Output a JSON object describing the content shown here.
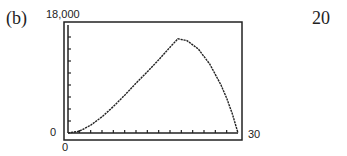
{
  "problem_label": "(b)",
  "next_problem_label": "20",
  "window": {
    "ymax_label": "18,000",
    "ymin_label": "0",
    "xmin_label": "0",
    "xmax_label": "30"
  },
  "chart_data": {
    "type": "line",
    "title": "",
    "xlabel": "",
    "ylabel": "",
    "xlim": [
      0,
      30
    ],
    "ylim": [
      0,
      18000
    ],
    "grid": false,
    "x_tick_step": 2,
    "y_tick_step": 2000,
    "x": [
      0,
      2,
      4,
      6,
      8,
      10,
      12,
      14,
      16,
      18,
      19.4,
      21,
      23,
      25,
      27,
      28,
      29,
      30
    ],
    "values": [
      0,
      300,
      1300,
      2700,
      4400,
      6300,
      8300,
      10200,
      12200,
      14300,
      15700,
      15400,
      14000,
      11500,
      8000,
      5800,
      3200,
      0
    ]
  }
}
